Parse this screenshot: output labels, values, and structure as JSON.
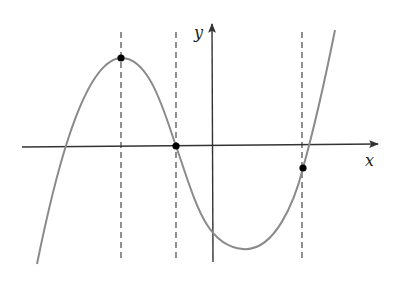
{
  "figure": {
    "type": "function-graph",
    "axes": {
      "x_label": "x",
      "y_label": "y",
      "x_axis": {
        "x1": 22,
        "y1": 147,
        "x2": 378,
        "y2": 144
      },
      "y_axis": {
        "x1": 213,
        "y1": 262,
        "x2": 212,
        "y2": 24
      },
      "color": "#333333"
    },
    "curve": {
      "color": "#8a8a8a",
      "path": "M37,264 C50,200 80,60 121,58 C150,57 165,115 176,146 C195,200 205,246 243,249 C275,252 295,200 303,168 C315,125 325,80 335,30"
    },
    "dashed_lines": [
      {
        "name": "local-max-guide",
        "x": 121,
        "y1": 32,
        "y2": 262
      },
      {
        "name": "zero-guide",
        "x": 176,
        "y1": 32,
        "y2": 262
      },
      {
        "name": "right-point-guide",
        "x": 302,
        "y1": 32,
        "y2": 262
      }
    ],
    "points": [
      {
        "name": "local-maximum-point",
        "x": 121,
        "y": 58
      },
      {
        "name": "zero-crossing-point",
        "x": 176,
        "y": 146
      },
      {
        "name": "right-point",
        "x": 303,
        "y": 168
      }
    ],
    "labels": {
      "x": {
        "text": "x",
        "x": 365,
        "y": 166
      },
      "y": {
        "text": "y",
        "x": 194,
        "y": 38
      }
    }
  }
}
